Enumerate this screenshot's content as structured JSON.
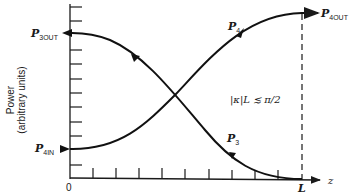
{
  "diagram": {
    "y_axis_title": "Power",
    "y_axis_subtitle": "(arbitrary units)",
    "x_axis_label": "z",
    "origin_label": "0",
    "length_label": "L",
    "condition_label": "|κ|L ≲ π/2",
    "curves": [
      {
        "name": "P4",
        "label_main": "P",
        "label_sub": "4",
        "direction": "forward",
        "from": "P4IN",
        "to": "P4OUT"
      },
      {
        "name": "P3",
        "label_main": "P",
        "label_sub": "3",
        "direction": "backward",
        "from": "P3(L)=0",
        "to": "P3OUT"
      }
    ],
    "endpoint_labels": {
      "p3out": {
        "main": "P",
        "sub": "3OUT"
      },
      "p4in": {
        "main": "P",
        "sub": "4IN"
      },
      "p4out": {
        "main": "P",
        "sub": "4OUT"
      }
    },
    "y_tick_count": 14,
    "x_tick_count": 10
  }
}
